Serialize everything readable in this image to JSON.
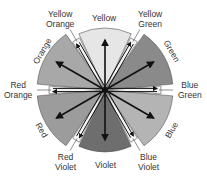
{
  "diagram": {
    "type": "color-wheel",
    "center": [
      105,
      90
    ],
    "primary_secondary": [
      {
        "name": "Yellow",
        "angle": 0,
        "radius": 62,
        "fill": "#e6e6e6"
      },
      {
        "name": "Green",
        "angle": 60,
        "radius": 68,
        "fill": "#8a8a8a"
      },
      {
        "name": "Blue",
        "angle": 120,
        "radius": 68,
        "fill": "#b4b4b4"
      },
      {
        "name": "Violet",
        "angle": 180,
        "radius": 62,
        "fill": "#6e6e6e"
      },
      {
        "name": "Red",
        "angle": 240,
        "radius": 68,
        "fill": "#9c9c9c"
      },
      {
        "name": "Orange",
        "angle": 300,
        "radius": 68,
        "fill": "#a8a8a8"
      }
    ],
    "tertiary": [
      {
        "name": "Yellow Green",
        "angle": 30,
        "radius": 58
      },
      {
        "name": "Blue Green",
        "angle": 90,
        "radius": 56
      },
      {
        "name": "Blue Violet",
        "angle": 150,
        "radius": 58
      },
      {
        "name": "Red Violet",
        "angle": 210,
        "radius": 58
      },
      {
        "name": "Red Orange",
        "angle": 270,
        "radius": 56
      },
      {
        "name": "Yellow Orange",
        "angle": 330,
        "radius": 58
      }
    ]
  },
  "labels": {
    "yellow": "Yellow",
    "yellow_green_1": "Yellow",
    "yellow_green_2": "Green",
    "green": "Green",
    "blue_green_1": "Blue",
    "blue_green_2": "Green",
    "blue": "Blue",
    "blue_violet_1": "Blue",
    "blue_violet_2": "Violet",
    "violet": "Violet",
    "red_violet_1": "Red",
    "red_violet_2": "Violet",
    "red": "Red",
    "red_orange_1": "Red",
    "red_orange_2": "Orange",
    "orange": "Orange",
    "yellow_orange_1": "Yellow",
    "yellow_orange_2": "Orange"
  }
}
